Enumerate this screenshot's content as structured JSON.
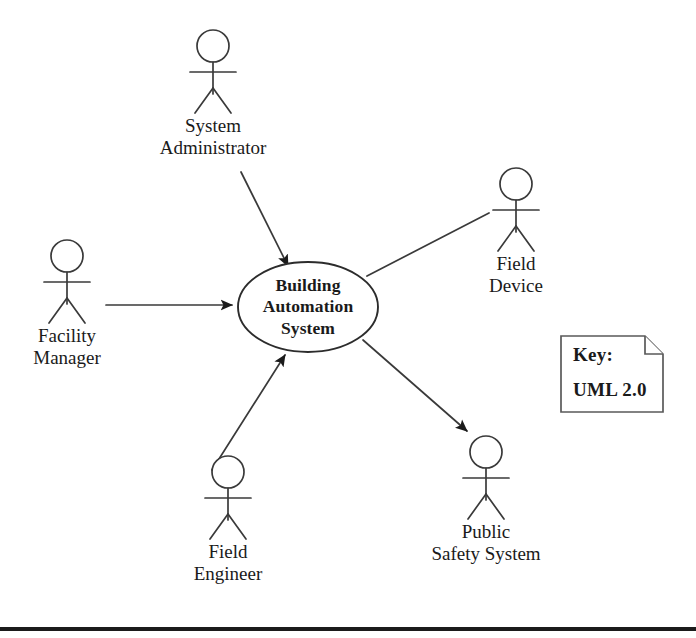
{
  "diagram": {
    "type": "uml-use-case-diagram",
    "notation": "UML 2.0",
    "canvas": {
      "width": 696,
      "height": 638,
      "background": "#ffffff"
    },
    "stroke_color": "#3a3a3a",
    "text_color": "#1a1a1a",
    "system": {
      "name": "Building\nAutomation\nSystem",
      "shape": "ellipse",
      "cx": 308,
      "cy": 307,
      "rx": 70,
      "ry": 45
    },
    "actors": [
      {
        "id": "system-administrator",
        "label": "System\nAdministrator",
        "figure_x": 213,
        "figure_y": 30,
        "label_x": 213,
        "label_y": 115,
        "relation": "to-system",
        "arrowhead": "filled"
      },
      {
        "id": "field-device",
        "label": "Field\nDevice",
        "figure_x": 516,
        "figure_y": 168,
        "label_x": 516,
        "label_y": 253,
        "relation": "association",
        "arrowhead": "none"
      },
      {
        "id": "facility-manager",
        "label": "Facility\nManager",
        "figure_x": 67,
        "figure_y": 240,
        "label_x": 67,
        "label_y": 325,
        "relation": "to-system",
        "arrowhead": "filled"
      },
      {
        "id": "field-engineer",
        "label": "Field\nEngineer",
        "figure_x": 228,
        "figure_y": 456,
        "label_x": 228,
        "label_y": 541,
        "relation": "to-system",
        "arrowhead": "filled"
      },
      {
        "id": "public-safety-system",
        "label": "Public\nSafety System",
        "figure_x": 486,
        "figure_y": 436,
        "label_x": 486,
        "label_y": 521,
        "relation": "from-system",
        "arrowhead": "filled"
      }
    ],
    "note": {
      "title": "Key:",
      "body": "UML  2.0",
      "x": 561,
      "y": 336,
      "width": 102,
      "height": 76,
      "fold": 18
    },
    "footer_rule": {
      "y": 627,
      "height": 4,
      "color": "#1b1b1b"
    }
  }
}
